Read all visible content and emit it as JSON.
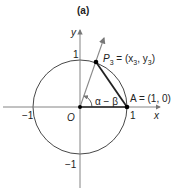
{
  "title": "(a)",
  "axes": {
    "x_label": "x",
    "y_label": "y"
  },
  "ticks": {
    "x_pos": "1",
    "x_neg": "−1",
    "y_pos": "1",
    "y_neg": "−1",
    "origin": "O"
  },
  "points": {
    "p3_name": "P",
    "p3_sub": "3",
    "p3_coords_prefix": " = (x",
    "p3_coords_sub1": "3",
    "p3_coords_mid": ", y",
    "p3_coords_sub2": "3",
    "p3_coords_suffix": ")",
    "a_label": "A = (1, 0)"
  },
  "angle_label": "α − β",
  "colors": {
    "line": "#222222",
    "ray": "#888888"
  }
}
